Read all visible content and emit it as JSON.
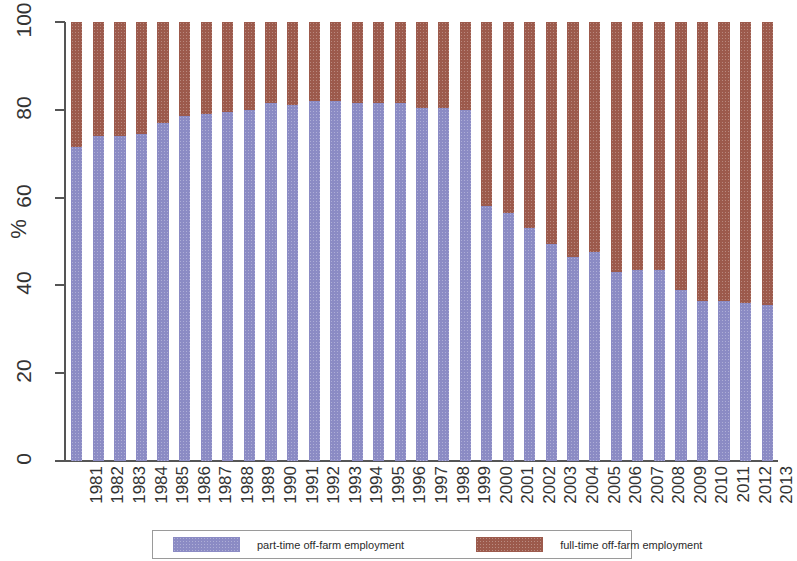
{
  "chart_data": {
    "type": "bar",
    "title": "",
    "subtitle": "",
    "xlabel": "",
    "ylabel": "%",
    "ylim": [
      0,
      100
    ],
    "yticks": [
      0,
      20,
      40,
      60,
      80,
      100
    ],
    "grid": false,
    "stacked": true,
    "stack_total": 100,
    "legend_position": "bottom",
    "categories": [
      "1981",
      "1982",
      "1983",
      "1984",
      "1985",
      "1986",
      "1987",
      "1988",
      "1989",
      "1990",
      "1991",
      "1992",
      "1993",
      "1994",
      "1995",
      "1996",
      "1997",
      "1998",
      "1999",
      "2000",
      "2001",
      "2002",
      "2003",
      "2004",
      "2005",
      "2006",
      "2007",
      "2008",
      "2009",
      "2010",
      "2011",
      "2012",
      "2013"
    ],
    "series": [
      {
        "name": "part-time off-farm employment",
        "color": "#8b8bc4",
        "values": [
          71.5,
          74.0,
          74.0,
          74.5,
          77.0,
          78.5,
          79.0,
          79.5,
          80.0,
          81.5,
          81.0,
          82.0,
          82.0,
          81.5,
          81.5,
          81.5,
          80.5,
          80.5,
          80.0,
          58.0,
          56.5,
          53.0,
          49.5,
          46.5,
          47.5,
          43.0,
          43.5,
          43.5,
          39.0,
          36.5,
          36.5,
          36.0,
          35.5
        ]
      },
      {
        "name": "full-time off-farm employment",
        "color": "#9c5a4c",
        "values": [
          28.5,
          26.0,
          26.0,
          25.5,
          23.0,
          21.5,
          21.0,
          20.5,
          20.0,
          18.5,
          19.0,
          18.0,
          18.0,
          18.5,
          18.5,
          18.5,
          19.5,
          19.5,
          20.0,
          42.0,
          43.5,
          47.0,
          50.5,
          53.5,
          52.5,
          57.0,
          56.5,
          56.5,
          61.0,
          63.5,
          63.5,
          64.0,
          64.5
        ]
      }
    ]
  },
  "legend": {
    "items": [
      {
        "label": "part-time off-farm employment",
        "color": "#8b8bc4"
      },
      {
        "label": "full-time off-farm employment",
        "color": "#9c5a4c"
      }
    ]
  }
}
